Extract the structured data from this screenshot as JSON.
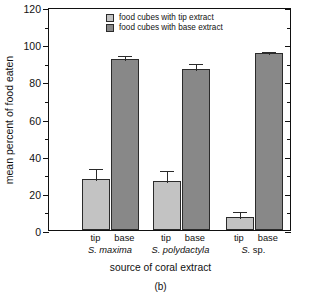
{
  "figure": {
    "caption": "(b)"
  },
  "legend": {
    "position": "top-left-inside",
    "items": [
      {
        "label": "food cubes with tip extract",
        "color": "#c3c3c3",
        "key": "tip"
      },
      {
        "label": "food cubes with base extract",
        "color": "#888888",
        "key": "base"
      }
    ]
  },
  "axes": {
    "ylabel": "mean percent of food eaten",
    "xlabel": "source of coral extract",
    "yticks": [
      "0",
      "20",
      "40",
      "60",
      "80",
      "100",
      "120"
    ],
    "yminor_step": 10,
    "ylim": [
      0,
      120
    ],
    "grid": false
  },
  "chart_data": {
    "type": "bar",
    "title": "",
    "xlabel": "source of coral extract",
    "ylabel": "mean percent of food eaten",
    "ylim": [
      0,
      120
    ],
    "ytick_values": [
      0,
      20,
      40,
      60,
      80,
      100,
      120
    ],
    "grid": false,
    "legend_position": "upper left (inside axes)",
    "categories": [
      "S. maxima",
      "S. polydactyla",
      "S. sp."
    ],
    "bar_labels": [
      "tip",
      "base"
    ],
    "series": [
      {
        "name": "food cubes with tip extract",
        "color": "#c3c3c3",
        "values": [
          27.5,
          26.5,
          7.0
        ],
        "errors": [
          6.5,
          6.5,
          3.5
        ]
      },
      {
        "name": "food cubes with base extract",
        "color": "#888888",
        "values": [
          92.0,
          86.5,
          95.0
        ],
        "errors": [
          2.8,
          4.0,
          2.0
        ]
      }
    ],
    "units": "percent"
  },
  "groups": [
    {
      "name_italic": "S. maxima",
      "bars": [
        {
          "label": "tip",
          "series": "tip",
          "value": 27.5,
          "error": 6.5
        },
        {
          "label": "base",
          "series": "base",
          "value": 92.0,
          "error": 2.8
        }
      ]
    },
    {
      "name_italic": "S. polydactyla",
      "bars": [
        {
          "label": "tip",
          "series": "tip",
          "value": 26.5,
          "error": 6.5
        },
        {
          "label": "base",
          "series": "base",
          "value": 86.5,
          "error": 4.0
        }
      ]
    },
    {
      "name_italic": "S. sp.",
      "bars": [
        {
          "label": "tip",
          "series": "tip",
          "value": 7.0,
          "error": 3.5
        },
        {
          "label": "base",
          "series": "base",
          "value": 95.0,
          "error": 2.0
        }
      ]
    }
  ]
}
